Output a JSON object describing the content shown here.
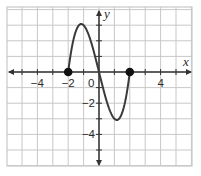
{
  "chart_data": {
    "type": "line",
    "title": "",
    "xlabel": "x",
    "ylabel": "y",
    "xlim": [
      -6,
      6
    ],
    "ylim": [
      -6,
      4
    ],
    "grid": true,
    "x_tick_labels": [
      {
        "value": -4,
        "label": "−4"
      },
      {
        "value": -2,
        "label": "−2"
      },
      {
        "value": 4,
        "label": "4"
      }
    ],
    "y_tick_labels": [
      {
        "value": -2,
        "label": "−2"
      },
      {
        "value": -4,
        "label": "−4"
      }
    ],
    "origin_label": "0",
    "series": [
      {
        "name": "f(x)",
        "description": "cubic curve on closed domain [-2, 2], approx y = x^3 - 4x",
        "domain": [
          -2,
          2
        ],
        "x": [
          -2,
          -1.5,
          -1.155,
          -1,
          -0.5,
          0,
          0.5,
          1,
          1.155,
          1.5,
          2
        ],
        "y": [
          0,
          2.6,
          3.1,
          3,
          1.9,
          0,
          -1.9,
          -3,
          -3.1,
          -2.6,
          0
        ],
        "color": "#3a3a3a"
      }
    ],
    "endpoints": [
      {
        "x": -2,
        "y": 0,
        "filled": true
      },
      {
        "x": 2,
        "y": 0,
        "filled": true
      }
    ]
  },
  "axes": {
    "x_name": "x",
    "y_name": "y"
  },
  "colors": {
    "grid": "#c8c8c8",
    "axis": "#333333",
    "curve": "#3a3a3a",
    "point": "#111111"
  }
}
